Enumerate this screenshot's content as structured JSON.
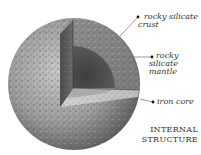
{
  "diagram": {
    "title_line1": "INTERNAL",
    "title_line2": "STRUCTURE",
    "layers": [
      {
        "label_line1": "rocky silicate",
        "label_line2": "crust"
      },
      {
        "label_line1": "rocky",
        "label_line2": "silicate",
        "label_line3": "mantle"
      },
      {
        "label_line1": "iron core"
      }
    ],
    "colors": {
      "surface": "#9a9a9a",
      "crust": "#b8b8b8",
      "mantle": "#6e6e6e",
      "core": "#4a4a4a",
      "text": "#333333"
    }
  }
}
